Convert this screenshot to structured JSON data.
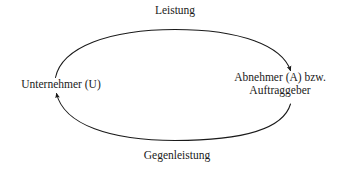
{
  "diagram": {
    "type": "cycle-diagram",
    "background_color": "#ffffff",
    "stroke_color": "#1a1a1a",
    "nodes": [
      {
        "id": "unternehmer",
        "label": "Unternehmer (U)",
        "position": "left"
      },
      {
        "id": "abnehmer",
        "label_line1": "Abnehmer (A) bzw.",
        "label_line2": "Auftraggeber",
        "position": "right"
      }
    ],
    "edges": [
      {
        "id": "leistung",
        "label": "Leistung",
        "from": "unternehmer",
        "to": "abnehmer",
        "position": "top",
        "direction": "clockwise"
      },
      {
        "id": "gegenleistung",
        "label": "Gegenleistung",
        "from": "abnehmer",
        "to": "unternehmer",
        "position": "bottom",
        "direction": "clockwise"
      }
    ]
  }
}
